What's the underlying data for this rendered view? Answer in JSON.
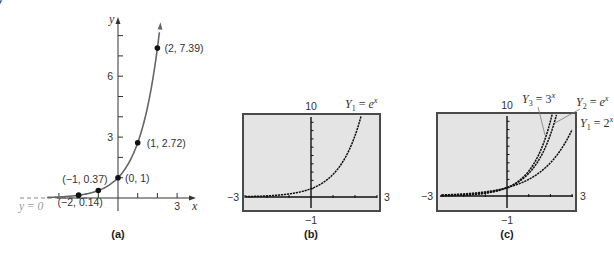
{
  "top_fragment": "y = ",
  "chart_data": [
    {
      "id": "a",
      "type": "line",
      "caption": "(a)",
      "title": "",
      "function": "y = e^x",
      "xlabel": "x",
      "ylabel": "y",
      "xlim": [
        -4.8,
        3.9
      ],
      "ylim": [
        -0.6,
        8.9
      ],
      "x_ticks": [
        -3,
        -2,
        -1,
        1,
        2,
        3
      ],
      "x_tick_labels": [
        {
          "value": 3,
          "label": "3"
        }
      ],
      "y_ticks": [
        1,
        2,
        3,
        4,
        5,
        6,
        7,
        8
      ],
      "y_tick_labels": [
        {
          "value": 3,
          "label": "3"
        },
        {
          "value": 6,
          "label": "6"
        }
      ],
      "grid": false,
      "asymptote": {
        "label": "y = 0",
        "y": 0,
        "style": "dashed"
      },
      "curve_x_range": [
        -4.8,
        2.13
      ],
      "points": [
        {
          "x": -2,
          "y": 0.14,
          "label": "(−2, 0.14)"
        },
        {
          "x": -1,
          "y": 0.37,
          "label": "(−1, 0.37)"
        },
        {
          "x": 0,
          "y": 1,
          "label": "(0, 1)"
        },
        {
          "x": 1,
          "y": 2.72,
          "label": "(1, 2.72)"
        },
        {
          "x": 2,
          "y": 7.39,
          "label": "(2, 7.39)"
        }
      ],
      "series": [
        {
          "name": "y = e^x",
          "x": [
            -2,
            -1,
            0,
            1,
            2
          ],
          "values": [
            0.14,
            0.37,
            1,
            2.72,
            7.39
          ],
          "color": "#666666"
        }
      ]
    },
    {
      "id": "b",
      "type": "line",
      "caption": "(b)",
      "title": "",
      "window": {
        "xmin": -3,
        "xmax": 3,
        "ymin": -1,
        "ymax": 10
      },
      "xmin_label": "−3",
      "xmax_label": "3",
      "ymin_label": "−1",
      "ymax_label": "10",
      "grid": false,
      "legend": [
        {
          "name": "Y1",
          "sub": "1",
          "expr": "e",
          "sup": "x"
        }
      ],
      "series": [
        {
          "name": "Y1 = e^x",
          "base": 2.71828,
          "x": [
            -3,
            -2,
            -1,
            0,
            1,
            2,
            2.3
          ],
          "values": [
            0.05,
            0.14,
            0.37,
            1,
            2.72,
            7.39,
            9.97
          ],
          "color": "#111111"
        }
      ],
      "screen_bg": "#e4e4e4",
      "screen_border": "#4a4a4a"
    },
    {
      "id": "c",
      "type": "line",
      "caption": "(c)",
      "title": "",
      "window": {
        "xmin": -3,
        "xmax": 3,
        "ymin": -1,
        "ymax": 10
      },
      "xmin_label": "−3",
      "xmax_label": "3",
      "ymin_label": "−1",
      "ymax_label": "10",
      "grid": false,
      "legend": [
        {
          "name": "Y3",
          "sub": "3",
          "expr": "3",
          "sup": "x"
        },
        {
          "name": "Y2",
          "sub": "2",
          "expr": "e",
          "sup": "x"
        },
        {
          "name": "Y1",
          "sub": "1",
          "expr": "2",
          "sup": "x"
        }
      ],
      "series": [
        {
          "name": "Y1 = 2^x",
          "base": 2,
          "x": [
            -3,
            -2,
            -1,
            0,
            1,
            2,
            3
          ],
          "values": [
            0.125,
            0.25,
            0.5,
            1,
            2,
            4,
            8
          ],
          "color": "#111111"
        },
        {
          "name": "Y2 = e^x",
          "base": 2.71828,
          "x": [
            -3,
            -2,
            -1,
            0,
            1,
            2,
            2.3
          ],
          "values": [
            0.05,
            0.14,
            0.37,
            1,
            2.72,
            7.39,
            9.97
          ],
          "color": "#111111"
        },
        {
          "name": "Y3 = 3^x",
          "base": 3,
          "x": [
            -3,
            -2,
            -1,
            0,
            1,
            2,
            2.1
          ],
          "values": [
            0.04,
            0.11,
            0.33,
            1,
            3,
            9,
            10.05
          ],
          "color": "#111111"
        }
      ],
      "screen_bg": "#e4e4e4",
      "screen_border": "#4a4a4a"
    }
  ]
}
